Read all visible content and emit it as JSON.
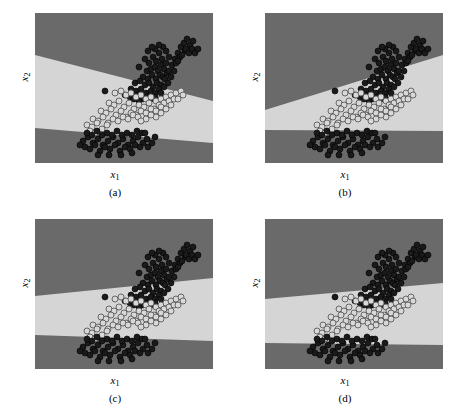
{
  "figure": {
    "title": "",
    "panel_count": 4,
    "layout": "2x2 grid"
  },
  "axis": {
    "xlabel": "x",
    "xlabel_sub": "1",
    "ylabel": "x",
    "ylabel_sub": "2"
  },
  "colors": {
    "region_dark": "#6e6e6e",
    "region_light": "#dcdcdc",
    "class_dark_marker": "#1a1a1a",
    "class_light_marker": "#d8d8d8",
    "marker_edge": "#5a5a5a",
    "background": "#ffffff",
    "text": "#000000"
  },
  "panels": [
    {
      "id": "a",
      "caption": "(a)",
      "name": "panel-a"
    },
    {
      "id": "b",
      "caption": "(b)",
      "name": "panel-b"
    },
    {
      "id": "c",
      "caption": "(c)",
      "name": "panel-c"
    },
    {
      "id": "d",
      "caption": "(d)",
      "name": "panel-d"
    }
  ],
  "chart_data": {
    "type": "scatter",
    "title": "",
    "xlabel": "x1",
    "ylabel": "x2",
    "grid": false,
    "legend": null,
    "axis_ranges": {
      "x": [
        0,
        178
      ],
      "y": [
        0,
        150
      ]
    },
    "note": "Four panels of the same 2D dataset with three decision regions; coordinates are in plot-pixel space (origin top-left of each plot frame, width 178, height 150).",
    "series": [
      {
        "name": "class-dark-upper",
        "marker": "filled-circle",
        "color": "#1a1a1a",
        "points": [
          [
            104,
            54
          ],
          [
            110,
            46
          ],
          [
            114,
            50
          ],
          [
            118,
            44
          ],
          [
            121,
            48
          ],
          [
            124,
            40
          ],
          [
            127,
            46
          ],
          [
            112,
            58
          ],
          [
            116,
            56
          ],
          [
            120,
            54
          ],
          [
            123,
            58
          ],
          [
            126,
            52
          ],
          [
            129,
            56
          ],
          [
            131,
            50
          ],
          [
            108,
            64
          ],
          [
            113,
            66
          ],
          [
            117,
            62
          ],
          [
            121,
            66
          ],
          [
            125,
            62
          ],
          [
            128,
            64
          ],
          [
            132,
            60
          ],
          [
            100,
            70
          ],
          [
            105,
            68
          ],
          [
            110,
            72
          ],
          [
            114,
            70
          ],
          [
            118,
            74
          ],
          [
            122,
            70
          ],
          [
            126,
            72
          ],
          [
            96,
            76
          ],
          [
            101,
            78
          ],
          [
            106,
            76
          ],
          [
            111,
            80
          ],
          [
            116,
            78
          ],
          [
            120,
            80
          ],
          [
            124,
            76
          ],
          [
            90,
            82
          ],
          [
            95,
            84
          ],
          [
            100,
            82
          ],
          [
            130,
            66
          ],
          [
            134,
            58
          ],
          [
            137,
            52
          ],
          [
            140,
            46
          ],
          [
            143,
            40
          ],
          [
            146,
            34
          ],
          [
            149,
            30
          ],
          [
            152,
            26
          ],
          [
            155,
            32
          ],
          [
            158,
            28
          ],
          [
            150,
            38
          ],
          [
            145,
            44
          ],
          [
            141,
            50
          ],
          [
            136,
            64
          ],
          [
            139,
            58
          ],
          [
            133,
            70
          ],
          [
            129,
            74
          ],
          [
            134,
            44
          ],
          [
            128,
            34
          ],
          [
            131,
            38
          ],
          [
            124,
            32
          ],
          [
            120,
            36
          ],
          [
            117,
            34
          ],
          [
            113,
            38
          ],
          [
            70,
            78
          ],
          [
            108,
            86
          ],
          [
            112,
            84
          ],
          [
            116,
            86
          ],
          [
            120,
            84
          ],
          [
            104,
            88
          ],
          [
            99,
            86
          ],
          [
            126,
            80
          ],
          [
            143,
            48
          ],
          [
            147,
            42
          ],
          [
            151,
            36
          ],
          [
            154,
            40
          ],
          [
            157,
            36
          ],
          [
            160,
            40
          ],
          [
            163,
            36
          ]
        ]
      },
      {
        "name": "class-light-middle",
        "marker": "open-circle",
        "color": "#d8d8d8",
        "points": [
          [
            80,
            80
          ],
          [
            86,
            78
          ],
          [
            91,
            82
          ],
          [
            96,
            80
          ],
          [
            101,
            84
          ],
          [
            106,
            82
          ],
          [
            111,
            86
          ],
          [
            116,
            84
          ],
          [
            121,
            88
          ],
          [
            126,
            86
          ],
          [
            131,
            84
          ],
          [
            136,
            82
          ],
          [
            141,
            80
          ],
          [
            146,
            78
          ],
          [
            74,
            90
          ],
          [
            79,
            92
          ],
          [
            84,
            88
          ],
          [
            89,
            94
          ],
          [
            94,
            90
          ],
          [
            99,
            96
          ],
          [
            104,
            92
          ],
          [
            109,
            94
          ],
          [
            114,
            90
          ],
          [
            119,
            96
          ],
          [
            124,
            92
          ],
          [
            129,
            90
          ],
          [
            134,
            88
          ],
          [
            139,
            86
          ],
          [
            66,
            98
          ],
          [
            71,
            100
          ],
          [
            76,
            96
          ],
          [
            81,
            102
          ],
          [
            86,
            98
          ],
          [
            91,
            104
          ],
          [
            96,
            100
          ],
          [
            101,
            102
          ],
          [
            106,
            98
          ],
          [
            111,
            100
          ],
          [
            116,
            96
          ],
          [
            121,
            98
          ],
          [
            126,
            94
          ],
          [
            58,
            106
          ],
          [
            63,
            108
          ],
          [
            68,
            104
          ],
          [
            73,
            110
          ],
          [
            78,
            106
          ],
          [
            83,
            108
          ],
          [
            88,
            104
          ],
          [
            93,
            106
          ],
          [
            98,
            102
          ],
          [
            103,
            104
          ],
          [
            52,
            112
          ],
          [
            57,
            114
          ],
          [
            62,
            110
          ],
          [
            67,
            116
          ],
          [
            72,
            112
          ],
          [
            55,
            118
          ],
          [
            60,
            120
          ],
          [
            143,
            86
          ],
          [
            148,
            82
          ],
          [
            136,
            92
          ],
          [
            131,
            96
          ],
          [
            126,
            100
          ],
          [
            121,
            104
          ],
          [
            116,
            102
          ],
          [
            111,
            106
          ],
          [
            106,
            108
          ]
        ]
      },
      {
        "name": "class-dark-lower",
        "marker": "filled-circle",
        "color": "#1a1a1a",
        "points": [
          [
            48,
            128
          ],
          [
            53,
            124
          ],
          [
            58,
            130
          ],
          [
            63,
            126
          ],
          [
            68,
            132
          ],
          [
            73,
            128
          ],
          [
            78,
            124
          ],
          [
            83,
            130
          ],
          [
            88,
            126
          ],
          [
            93,
            132
          ],
          [
            98,
            128
          ],
          [
            103,
            124
          ],
          [
            108,
            130
          ],
          [
            50,
            134
          ],
          [
            55,
            136
          ],
          [
            60,
            132
          ],
          [
            65,
            138
          ],
          [
            70,
            134
          ],
          [
            75,
            136
          ],
          [
            80,
            132
          ],
          [
            85,
            138
          ],
          [
            90,
            134
          ],
          [
            95,
            136
          ],
          [
            100,
            132
          ],
          [
            105,
            134
          ],
          [
            52,
            120
          ],
          [
            57,
            122
          ],
          [
            62,
            118
          ],
          [
            67,
            122
          ],
          [
            72,
            120
          ],
          [
            77,
            122
          ],
          [
            82,
            118
          ],
          [
            87,
            122
          ],
          [
            92,
            120
          ],
          [
            97,
            122
          ],
          [
            102,
            118
          ],
          [
            107,
            120
          ],
          [
            112,
            126
          ],
          [
            113,
            134
          ],
          [
            117,
            130
          ],
          [
            120,
            124
          ],
          [
            45,
            132
          ],
          [
            110,
            120
          ],
          [
            63,
            142
          ],
          [
            74,
            142
          ],
          [
            86,
            142
          ],
          [
            97,
            140
          ]
        ]
      }
    ],
    "regions": [
      {
        "panel": "a",
        "description": "Light band between two dark regions; band slopes downward to the right.",
        "upper_boundary": {
          "left_y": 42,
          "right_y": 88
        },
        "lower_boundary": {
          "left_y": 115,
          "right_y": 130
        }
      },
      {
        "panel": "b",
        "description": "Light band widens to the right; lower boundary horizontal.",
        "upper_boundary": {
          "left_y": 97,
          "right_y": 42
        },
        "lower_boundary": {
          "left_y": 117,
          "right_y": 118
        }
      },
      {
        "panel": "c",
        "description": "Narrow light band rising slightly to the right.",
        "upper_boundary": {
          "left_y": 77,
          "right_y": 59
        },
        "lower_boundary": {
          "left_y": 116,
          "right_y": 122
        }
      },
      {
        "panel": "d",
        "description": "Light band rising to the right, lower boundary nearly horizontal.",
        "upper_boundary": {
          "left_y": 80,
          "right_y": 64
        },
        "lower_boundary": {
          "left_y": 124,
          "right_y": 126
        }
      }
    ]
  }
}
